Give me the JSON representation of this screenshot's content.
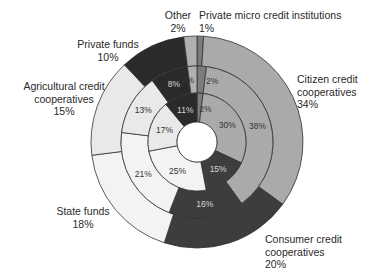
{
  "chart_data": {
    "type": "pie",
    "subtype": "nested-donut",
    "title": "",
    "start_angle_deg": 0,
    "direction": "clockwise",
    "categories": [
      "Private micro credit institutions",
      "Citizen credit cooperatives",
      "Consumer credit cooperatives",
      "State funds",
      "Agricultural credit cooperatives",
      "Private funds",
      "Other"
    ],
    "colors": [
      "#7c7c7c",
      "#aaaaaa",
      "#3d3d3d",
      "#f3f3f3",
      "#e9e9e9",
      "#2a2a2a",
      "#b0b0b0"
    ],
    "series": [
      {
        "name": "outer ring",
        "values": [
          1,
          34,
          20,
          18,
          15,
          10,
          2
        ]
      },
      {
        "name": "middle ring",
        "values": [
          2,
          38,
          16,
          21,
          13,
          8,
          2
        ]
      },
      {
        "name": "inner ring",
        "values": [
          2,
          30,
          15,
          25,
          17,
          11,
          0
        ]
      }
    ],
    "ring_labels": {
      "middle": [
        "2%",
        "38%",
        "16%",
        "21%",
        "13%",
        "8%",
        "2%"
      ],
      "inner": [
        "2%",
        "30%",
        "15%",
        "25%",
        "17%",
        "11%",
        ""
      ]
    },
    "legend_labels": [
      {
        "name": "Other",
        "value": "2%"
      },
      {
        "name": "Private micro credit institutions",
        "value": "1%"
      },
      {
        "name": "Private funds",
        "value": "10%"
      },
      {
        "name": "Citizen credit cooperatives",
        "value": "34%",
        "line1": "Citizen credit",
        "line2": "cooperatives"
      },
      {
        "name": "Agricultural credit cooperatives",
        "value": "15%",
        "line1": "Agricultural credit",
        "line2": "cooperatives"
      },
      {
        "name": "State funds",
        "value": "18%"
      },
      {
        "name": "Consumer credit cooperatives",
        "value": "20%",
        "line1": "Consumer credit",
        "line2": "cooperatives"
      }
    ]
  },
  "labels": {
    "other": {
      "name": "Other",
      "value": "2%"
    },
    "micro": {
      "name": "Private micro credit institutions",
      "value": "1%"
    },
    "private_funds": {
      "name": "Private funds",
      "value": "10%"
    },
    "citizen": {
      "line1": "Citizen credit",
      "line2": "cooperatives",
      "value": "34%"
    },
    "agri": {
      "line1": "Agricultural credit",
      "line2": "cooperatives",
      "value": "15%"
    },
    "state": {
      "name": "State funds",
      "value": "18%"
    },
    "consumer": {
      "line1": "Consumer credit",
      "line2": "cooperatives",
      "value": "20%"
    }
  }
}
